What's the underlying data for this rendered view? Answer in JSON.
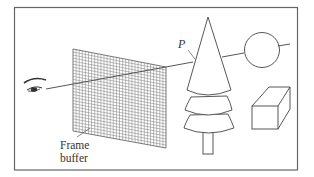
{
  "diagram": {
    "labels": {
      "frame_buffer_line1": "Frame",
      "frame_buffer_line2": "buffer",
      "point": "P"
    },
    "colors": {
      "stroke": "#555555",
      "grid": "#777777",
      "border": "#666666",
      "background": "#ffffff",
      "text": "#333333"
    },
    "objects": [
      {
        "name": "eye",
        "kind": "viewer"
      },
      {
        "name": "frame-buffer",
        "kind": "pixel-grid"
      },
      {
        "name": "tree",
        "kind": "cone-stack"
      },
      {
        "name": "sphere",
        "kind": "circle"
      },
      {
        "name": "box",
        "kind": "cuboid"
      }
    ]
  }
}
